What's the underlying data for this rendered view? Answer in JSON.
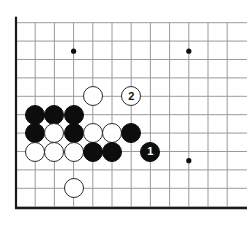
{
  "diagram": {
    "board_label": "go-board",
    "background_color": "#ffffff",
    "line_color": "#9a9a9a",
    "edge_color": "#1a1a1a",
    "black_stone_color": "#0d0d0d",
    "white_stone_color": "#ffffff",
    "star_point_color": "#111111",
    "grid": {
      "columns": 12,
      "rows": 11,
      "origin_x": 16,
      "origin_y": 22.7,
      "col_spacing": 19.2,
      "row_spacing": 18.4,
      "stone_diameter": 20
    },
    "star_points": [
      {
        "col": 3,
        "row": 1.55,
        "name": "star-point-upper-left"
      },
      {
        "col": 9,
        "row": 1.55,
        "name": "star-point-upper-right"
      },
      {
        "col": 9,
        "row": 7.5,
        "name": "star-point-lower-right"
      }
    ],
    "stones": [
      {
        "id": "w-c4-r4",
        "color": "white",
        "col": 4,
        "row": 4,
        "label": ""
      },
      {
        "id": "w-c6-r4",
        "color": "white",
        "col": 6,
        "row": 4,
        "label": "2"
      },
      {
        "id": "b-c1-r5",
        "color": "black",
        "col": 1,
        "row": 5,
        "label": ""
      },
      {
        "id": "b-c2-r5",
        "color": "black",
        "col": 2,
        "row": 5,
        "label": ""
      },
      {
        "id": "b-c3-r5",
        "color": "black",
        "col": 3,
        "row": 5,
        "label": ""
      },
      {
        "id": "b-c1-r6",
        "color": "black",
        "col": 1,
        "row": 6,
        "label": ""
      },
      {
        "id": "w-c2-r6",
        "color": "white",
        "col": 2,
        "row": 6,
        "label": ""
      },
      {
        "id": "b-c3-r6",
        "color": "black",
        "col": 3,
        "row": 6,
        "label": ""
      },
      {
        "id": "w-c4-r6",
        "color": "white",
        "col": 4,
        "row": 6,
        "label": ""
      },
      {
        "id": "w-c5-r6",
        "color": "white",
        "col": 5,
        "row": 6,
        "label": ""
      },
      {
        "id": "b-c6-r6",
        "color": "black",
        "col": 6,
        "row": 6,
        "label": ""
      },
      {
        "id": "w-c1-r7",
        "color": "white",
        "col": 1,
        "row": 7,
        "label": ""
      },
      {
        "id": "w-c2-r7",
        "color": "white",
        "col": 2,
        "row": 7,
        "label": ""
      },
      {
        "id": "w-c3-r7",
        "color": "white",
        "col": 3,
        "row": 7,
        "label": ""
      },
      {
        "id": "b-c4-r7",
        "color": "black",
        "col": 4,
        "row": 7,
        "label": ""
      },
      {
        "id": "b-c5-r7",
        "color": "black",
        "col": 5,
        "row": 7,
        "label": ""
      },
      {
        "id": "b-c7-r7",
        "color": "black",
        "col": 7,
        "row": 7,
        "label": "1"
      },
      {
        "id": "w-c3-r9",
        "color": "white",
        "col": 3,
        "row": 9,
        "label": ""
      }
    ],
    "move_markers": [
      {
        "number": "1",
        "color": "black",
        "description": "black move one"
      },
      {
        "number": "2",
        "color": "white",
        "description": "white move two"
      }
    ]
  }
}
